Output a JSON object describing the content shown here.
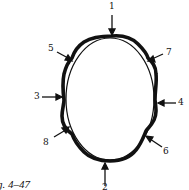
{
  "figure": {
    "caption": "ig. 4–47",
    "labels": {
      "l1": "1",
      "l2": "2",
      "l3": "3",
      "l4": "4",
      "l5": "5",
      "l6": "6",
      "l7": "7",
      "l8": "8"
    },
    "colors": {
      "stroke": "#111111",
      "background": "#ffffff"
    }
  }
}
